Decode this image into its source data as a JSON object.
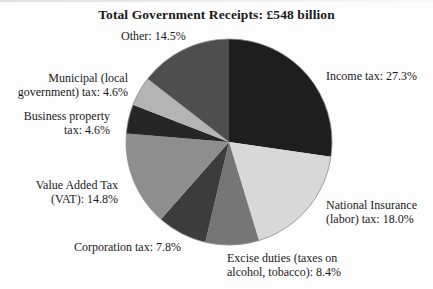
{
  "title": "Total Government Receipts: £548 billion",
  "chart_data": {
    "type": "pie",
    "title": "Total Government Receipts: £548 billion",
    "total_label": "£548 billion",
    "categories": [
      "Income tax",
      "National Insurance (labor) tax",
      "Excise duties (taxes on alcohol, tobacco)",
      "Corporation tax",
      "Value Added Tax (VAT)",
      "Business property tax",
      "Municipal (local government) tax",
      "Other"
    ],
    "values": [
      27.3,
      18.0,
      8.4,
      7.8,
      14.8,
      4.6,
      4.6,
      14.5
    ],
    "unit": "%",
    "start_angle_deg_from_top": 0,
    "direction": "clockwise",
    "slice_ids": [
      "income-tax",
      "national-insurance",
      "excise-duties",
      "corporation-tax",
      "vat",
      "business-property",
      "municipal-tax",
      "other"
    ],
    "colors": [
      "#1e1e1e",
      "#d8d8d8",
      "#767676",
      "#3c3c3c",
      "#8e8e8e",
      "#262626",
      "#b4b4b4",
      "#4e4e4e"
    ],
    "outline_color": "#8a8a8a",
    "legend": "none",
    "labels_on_chart": true
  },
  "labels": {
    "other": "Other: 14.5%",
    "income": "Income tax: 27.3%",
    "municipal_l1": "Municipal (local",
    "municipal_l2": "government) tax: 4.6%",
    "business_l1": "Business property",
    "business_l2": "tax: 4.6%",
    "vat_l1": "Value Added Tax",
    "vat_l2": "(VAT): 14.8%",
    "corporation": "Corporation tax: 7.8%",
    "national_l1": "National Insurance",
    "national_l2": "(labor) tax: 18.0%",
    "excise_l1": "Excise duties (taxes on",
    "excise_l2": "alcohol, tobacco): 8.4%"
  }
}
